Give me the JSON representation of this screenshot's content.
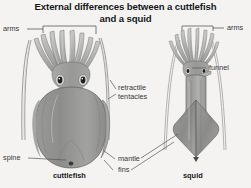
{
  "figure": {
    "title_line1": "External differences between a cuttlefish",
    "title_line2": "and a squid",
    "background_color": "#f4f3f1",
    "ink_color": "#35383c",
    "title_color": "#17191b"
  },
  "labels": {
    "arms_left": "arms",
    "arms_right": "arms",
    "funnel": "funnel",
    "retractile": "retractile",
    "tentacles": "tentacles",
    "spine": "spine",
    "mantle": "mantle",
    "fins": "fins",
    "cuttlefish": "cuttlefish",
    "squid": "squid"
  },
  "specimens": [
    {
      "name": "cuttlefish",
      "caption": "cuttlefish",
      "body_shape": "broad oval mantle with lateral fin fringe",
      "parts": [
        "arms",
        "retractile tentacles",
        "spine",
        "mantle",
        "fins"
      ]
    },
    {
      "name": "squid",
      "caption": "squid",
      "body_shape": "elongated cylindrical mantle with terminal diamond fins",
      "parts": [
        "arms",
        "funnel",
        "mantle",
        "fins"
      ]
    }
  ]
}
